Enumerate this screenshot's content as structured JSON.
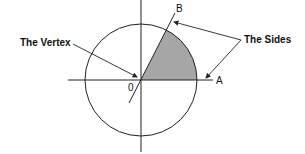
{
  "diagram": {
    "labels": {
      "vertex": "The Vertex",
      "sides": "The Sides",
      "point_a": "A",
      "point_b": "B",
      "origin": "0"
    },
    "colors": {
      "stroke": "#222222",
      "sector_fill": "#a6a6a6"
    }
  }
}
